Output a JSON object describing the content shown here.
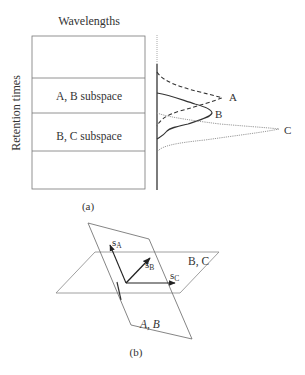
{
  "panel_a": {
    "title": "Wavelengths",
    "y_axis_label": "Retention times",
    "region_labels": [
      "A, B subspace",
      "B, C subspace"
    ],
    "peak_labels": {
      "a": "A",
      "b": "B",
      "c": "C"
    },
    "caption": "(a)"
  },
  "panel_b": {
    "vector_labels": {
      "a": "s",
      "a_sub": "A",
      "b": "s",
      "b_sub": "B",
      "c": "s",
      "c_sub": "C"
    },
    "plane_labels": {
      "horizontal": "B, C",
      "vertical": "A, B"
    },
    "caption": "(b)"
  }
}
